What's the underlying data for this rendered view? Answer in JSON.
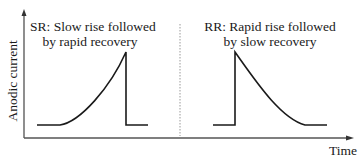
{
  "diagram": {
    "axes": {
      "y_label": "Anodic current",
      "x_label": "Time"
    },
    "panels": [
      {
        "id": "SR",
        "title_line1": "SR: Slow rise followed",
        "title_line2": "by rapid recovery",
        "shape": "slow-rise-rapid-recovery"
      },
      {
        "id": "RR",
        "title_line1": "RR: Rapid rise followed",
        "title_line2": "by slow recovery",
        "shape": "rapid-rise-slow-recovery"
      }
    ],
    "colors": {
      "line": "#1a1a1a",
      "axis": "#444444",
      "divider": "#999999",
      "background": "#ffffff"
    }
  }
}
